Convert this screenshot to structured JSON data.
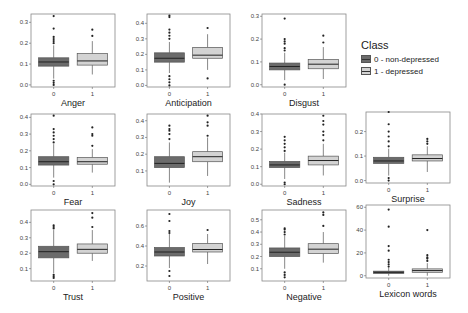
{
  "legend": {
    "title": "Class",
    "items": [
      {
        "label": "0 - non-depressed",
        "color": "#6b6b6b"
      },
      {
        "label": "1 - depressed",
        "color": "#d3d3d3"
      }
    ]
  },
  "chart_data": [
    {
      "type": "box",
      "title": "Anger",
      "categories": [
        "0",
        "1"
      ],
      "yticks": [
        0.0,
        0.1,
        0.2,
        0.3
      ],
      "ylim": [
        -0.01,
        0.34
      ],
      "series": [
        {
          "name": "0 - non-depressed",
          "q1": 0.09,
          "median": 0.11,
          "q3": 0.13,
          "whisker_low": 0.03,
          "whisker_high": 0.19,
          "outliers": [
            0.0,
            0.01,
            0.02,
            0.2,
            0.21,
            0.22,
            0.23,
            0.27,
            0.33
          ]
        },
        {
          "name": "1 - depressed",
          "q1": 0.095,
          "median": 0.115,
          "q3": 0.15,
          "whisker_low": 0.05,
          "whisker_high": 0.21,
          "outliers": [
            0.235,
            0.265
          ]
        }
      ]
    },
    {
      "type": "box",
      "title": "Anticipation",
      "categories": [
        "0",
        "1"
      ],
      "yticks": [
        0.0,
        0.1,
        0.2,
        0.3,
        0.4
      ],
      "ylim": [
        -0.01,
        0.46
      ],
      "series": [
        {
          "name": "0 - non-depressed",
          "q1": 0.15,
          "median": 0.175,
          "q3": 0.21,
          "whisker_low": 0.08,
          "whisker_high": 0.28,
          "outliers": [
            0.0,
            0.02,
            0.04,
            0.06,
            0.3,
            0.32,
            0.34,
            0.36,
            0.44,
            0.45
          ]
        },
        {
          "name": "1 - depressed",
          "q1": 0.175,
          "median": 0.195,
          "q3": 0.245,
          "whisker_low": 0.1,
          "whisker_high": 0.33,
          "outliers": [
            0.045,
            0.37
          ]
        }
      ]
    },
    {
      "type": "box",
      "title": "Disgust",
      "categories": [
        "0",
        "1"
      ],
      "yticks": [
        0.0,
        0.1,
        0.2,
        0.3
      ],
      "ylim": [
        -0.01,
        0.31
      ],
      "series": [
        {
          "name": "0 - non-depressed",
          "q1": 0.065,
          "median": 0.08,
          "q3": 0.095,
          "whisker_low": 0.02,
          "whisker_high": 0.14,
          "outliers": [
            0.0,
            0.15,
            0.16,
            0.18,
            0.19,
            0.2,
            0.29
          ]
        },
        {
          "name": "1 - depressed",
          "q1": 0.07,
          "median": 0.09,
          "q3": 0.11,
          "whisker_low": 0.025,
          "whisker_high": 0.165,
          "outliers": [
            0.185,
            0.215
          ]
        }
      ]
    },
    {
      "type": "box",
      "title": "Fear",
      "categories": [
        "0",
        "1"
      ],
      "yticks": [
        0.0,
        0.1,
        0.2,
        0.3,
        0.4
      ],
      "ylim": [
        -0.01,
        0.42
      ],
      "series": [
        {
          "name": "0 - non-depressed",
          "q1": 0.115,
          "median": 0.135,
          "q3": 0.165,
          "whisker_low": 0.04,
          "whisker_high": 0.24,
          "outliers": [
            0.0,
            0.02,
            0.25,
            0.27,
            0.29,
            0.31,
            0.33,
            0.41
          ]
        },
        {
          "name": "1 - depressed",
          "q1": 0.12,
          "median": 0.135,
          "q3": 0.16,
          "whisker_low": 0.07,
          "whisker_high": 0.21,
          "outliers": [
            0.23,
            0.29,
            0.3,
            0.34
          ]
        }
      ]
    },
    {
      "type": "box",
      "title": "Joy",
      "categories": [
        "0",
        "1"
      ],
      "yticks": [
        0.1,
        0.2,
        0.3,
        0.4
      ],
      "ylim": [
        0.01,
        0.44
      ],
      "series": [
        {
          "name": "0 - non-depressed",
          "q1": 0.12,
          "median": 0.145,
          "q3": 0.185,
          "whisker_low": 0.03,
          "whisker_high": 0.27,
          "outliers": [
            0.29,
            0.32,
            0.34,
            0.35,
            0.37
          ]
        },
        {
          "name": "1 - depressed",
          "q1": 0.155,
          "median": 0.185,
          "q3": 0.215,
          "whisker_low": 0.07,
          "whisker_high": 0.3,
          "outliers": [
            0.31,
            0.37,
            0.39,
            0.43
          ]
        }
      ]
    },
    {
      "type": "box",
      "title": "Sadness",
      "categories": [
        "0",
        "1"
      ],
      "yticks": [
        0.0,
        0.1,
        0.2,
        0.3,
        0.4
      ],
      "ylim": [
        -0.01,
        0.4
      ],
      "series": [
        {
          "name": "0 - non-depressed",
          "q1": 0.095,
          "median": 0.11,
          "q3": 0.13,
          "whisker_low": 0.03,
          "whisker_high": 0.18,
          "outliers": [
            0.0,
            0.01,
            0.19,
            0.21,
            0.23,
            0.25,
            0.27
          ]
        },
        {
          "name": "1 - depressed",
          "q1": 0.11,
          "median": 0.135,
          "q3": 0.16,
          "whisker_low": 0.05,
          "whisker_high": 0.23,
          "outliers": [
            0.25,
            0.28,
            0.3,
            0.34,
            0.36,
            0.39
          ]
        }
      ]
    },
    {
      "type": "box",
      "title": "Surprise",
      "categories": [
        "0",
        "1"
      ],
      "yticks": [
        0.0,
        0.1,
        0.2
      ],
      "ylim": [
        -0.01,
        0.28
      ],
      "series": [
        {
          "name": "0 - non-depressed",
          "q1": 0.07,
          "median": 0.08,
          "q3": 0.095,
          "whisker_low": 0.02,
          "whisker_high": 0.13,
          "outliers": [
            0.0,
            0.01,
            0.14,
            0.16,
            0.18,
            0.2,
            0.23,
            0.28
          ]
        },
        {
          "name": "1 - depressed",
          "q1": 0.08,
          "median": 0.09,
          "q3": 0.105,
          "whisker_low": 0.035,
          "whisker_high": 0.14,
          "outliers": [
            0.15,
            0.16,
            0.17
          ]
        }
      ]
    },
    {
      "type": "box",
      "title": "Trust",
      "categories": [
        "0",
        "1"
      ],
      "yticks": [
        0.1,
        0.2,
        0.3,
        0.4
      ],
      "ylim": [
        0.02,
        0.48
      ],
      "series": [
        {
          "name": "0 - non-depressed",
          "q1": 0.17,
          "median": 0.21,
          "q3": 0.245,
          "whisker_low": 0.07,
          "whisker_high": 0.35,
          "outliers": [
            0.04,
            0.05,
            0.06,
            0.36,
            0.37,
            0.38
          ]
        },
        {
          "name": "1 - depressed",
          "q1": 0.2,
          "median": 0.225,
          "q3": 0.26,
          "whisker_low": 0.15,
          "whisker_high": 0.35,
          "outliers": [
            0.37,
            0.43,
            0.46
          ]
        }
      ]
    },
    {
      "type": "box",
      "title": "Positive",
      "categories": [
        "0",
        "1"
      ],
      "yticks": [
        0.2,
        0.4,
        0.6
      ],
      "ylim": [
        0.05,
        0.76
      ],
      "series": [
        {
          "name": "0 - non-depressed",
          "q1": 0.3,
          "median": 0.34,
          "q3": 0.385,
          "whisker_low": 0.18,
          "whisker_high": 0.52,
          "outliers": [
            0.1,
            0.15,
            0.53,
            0.55,
            0.65,
            0.72
          ]
        },
        {
          "name": "1 - depressed",
          "q1": 0.34,
          "median": 0.365,
          "q3": 0.425,
          "whisker_low": 0.22,
          "whisker_high": 0.52,
          "outliers": [
            0.56
          ]
        }
      ]
    },
    {
      "type": "box",
      "title": "Negative",
      "categories": [
        "0",
        "1"
      ],
      "yticks": [
        0.1,
        0.2,
        0.3,
        0.4,
        0.5
      ],
      "ylim": [
        0.0,
        0.58
      ],
      "series": [
        {
          "name": "0 - non-depressed",
          "q1": 0.2,
          "median": 0.235,
          "q3": 0.27,
          "whisker_low": 0.1,
          "whisker_high": 0.37,
          "outliers": [
            0.03,
            0.05,
            0.07,
            0.38,
            0.4,
            0.42,
            0.43
          ]
        },
        {
          "name": "1 - depressed",
          "q1": 0.225,
          "median": 0.26,
          "q3": 0.305,
          "whisker_low": 0.15,
          "whisker_high": 0.4,
          "outliers": [
            0.45,
            0.54,
            0.56
          ]
        }
      ]
    },
    {
      "type": "box",
      "title": "Lexicon words",
      "categories": [
        "0",
        "1"
      ],
      "yticks": [
        0,
        20,
        40,
        60
      ],
      "ylim": [
        -2,
        62
      ],
      "series": [
        {
          "name": "0 - non-depressed",
          "q1": 2,
          "median": 3,
          "q3": 4,
          "whisker_low": 0,
          "whisker_high": 7,
          "outliers": [
            8,
            10,
            12,
            14,
            22,
            26,
            43,
            58
          ]
        },
        {
          "name": "1 - depressed",
          "q1": 3,
          "median": 4.5,
          "q3": 6,
          "whisker_low": 0,
          "whisker_high": 11,
          "outliers": [
            13,
            15,
            16,
            18,
            40
          ]
        }
      ]
    }
  ]
}
